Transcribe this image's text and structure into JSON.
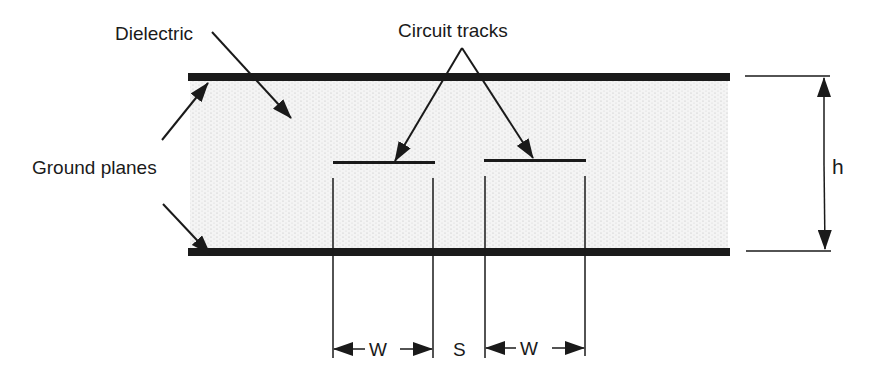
{
  "diagram": {
    "type": "stripline cross-section (edge-coupled differential pair)",
    "labels": {
      "dielectric": "Dielectric",
      "circuit_tracks": "Circuit tracks",
      "ground_planes": "Ground planes",
      "height": "h",
      "width_left": "W",
      "spacing": "S",
      "width_right": "W"
    },
    "colors": {
      "line": "#1a1a1a",
      "dielectric_fill": "#f1f1f1",
      "dielectric_dots": "#bdbdbd",
      "background": "#ffffff"
    },
    "components": [
      {
        "name": "top-ground-plane",
        "role": "Ground plane"
      },
      {
        "name": "bottom-ground-plane",
        "role": "Ground plane"
      },
      {
        "name": "dielectric",
        "role": "Dielectric"
      },
      {
        "name": "left-track",
        "role": "Circuit track"
      },
      {
        "name": "right-track",
        "role": "Circuit track"
      }
    ],
    "dimensions": [
      {
        "symbol": "h",
        "meaning": "dielectric height between ground planes"
      },
      {
        "symbol": "W",
        "meaning": "track width"
      },
      {
        "symbol": "S",
        "meaning": "track spacing"
      }
    ]
  }
}
